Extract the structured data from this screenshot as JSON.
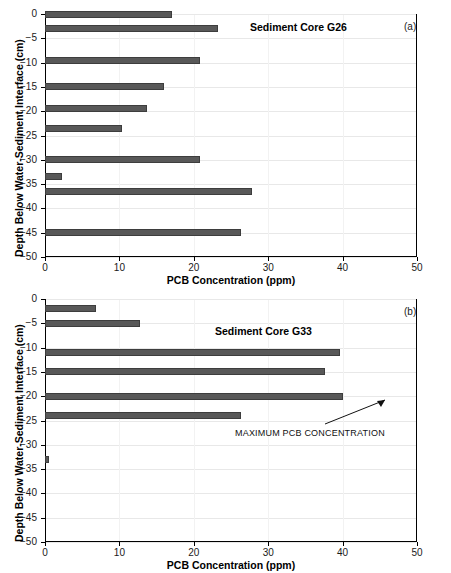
{
  "figure": {
    "axis_titles": {
      "x": "PCB Concentration (ppm)",
      "y": "Depth Below Water-Sediment Interface (cm)"
    },
    "xticks": [
      "0",
      "10",
      "20",
      "30",
      "40",
      "50"
    ],
    "yticks": [
      "0",
      "−5",
      "−10",
      "−15",
      "−20",
      "−25",
      "−30",
      "−35",
      "−40",
      "−45",
      "−50"
    ],
    "bar_color": "#585858",
    "axis_color": "#000000",
    "grid_color": "#e8e8e8"
  },
  "panel_a": {
    "letter": "(a)",
    "title": "Sediment Core G26"
  },
  "panel_b": {
    "letter": "(b)",
    "title": "Sediment Core G33",
    "annotation": "MAXIMUM PCB CONCENTRATION"
  },
  "chart_data": [
    {
      "type": "bar",
      "orientation": "horizontal",
      "title": "Sediment Core G26",
      "panel": "(a)",
      "xlabel": "PCB Concentration (ppm)",
      "ylabel": "Depth Below Water-Sediment Interface (cm)",
      "xlim": [
        0,
        50
      ],
      "ylim": [
        -50,
        0
      ],
      "xticks": [
        0,
        10,
        20,
        30,
        40,
        50
      ],
      "yticks": [
        0,
        -5,
        -10,
        -15,
        -20,
        -25,
        -30,
        -35,
        -40,
        -45,
        -50
      ],
      "grid": true,
      "legend": "none",
      "depths_cm": [
        0,
        -3,
        -9.5,
        -15,
        -19.5,
        -23.5,
        -30,
        -33.5,
        -36.5,
        -45
      ],
      "values": [
        17.1,
        23.2,
        20.8,
        16.0,
        13.7,
        10.3,
        20.8,
        2.3,
        27.8,
        26.4
      ]
    },
    {
      "type": "bar",
      "orientation": "horizontal",
      "title": "Sediment Core G33",
      "panel": "(b)",
      "xlabel": "PCB Concentration (ppm)",
      "ylabel": "Depth Below Water-Sediment Interface (cm)",
      "xlim": [
        0,
        50
      ],
      "ylim": [
        -50,
        0
      ],
      "xticks": [
        0,
        10,
        20,
        30,
        40,
        50
      ],
      "yticks": [
        0,
        -5,
        -10,
        -15,
        -20,
        -25,
        -30,
        -35,
        -40,
        -45,
        -50
      ],
      "grid": true,
      "legend": "none",
      "annotations": [
        {
          "text": "MAXIMUM PCB CONCENTRATION",
          "points_to_depth_cm": -20,
          "points_to_value": 40.0
        }
      ],
      "depths_cm": [
        -2,
        -5,
        -11,
        -15,
        -20,
        -24,
        -33
      ],
      "values": [
        6.9,
        12.8,
        39.6,
        37.6,
        40.0,
        26.3,
        0.5
      ]
    }
  ]
}
